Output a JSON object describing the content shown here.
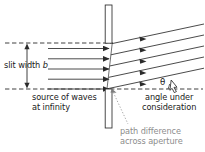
{
  "figure": {
    "background_color": "#ffffff",
    "line_color": "#2b2b2b",
    "gray_color": "#8d8d8d"
  },
  "labels": {
    "slit_width": {
      "text_prefix": "slit width ",
      "symbol": "b"
    },
    "source": {
      "line1": "source of waves",
      "line2": "at infinity"
    },
    "angle_note": {
      "line1": "angle under",
      "line2": "consideration"
    },
    "path_difference": {
      "line1": "path difference",
      "line2": "across aperture"
    },
    "theta": "θ"
  },
  "geometry": {
    "incoming_ray_count": 5,
    "outgoing_ray_count": 5,
    "slit_top_y": 43,
    "slit_bottom_y": 89,
    "slit_x": 110,
    "aperture_plate_x": 105,
    "aperture_plate_width": 7,
    "upper_plate_top_y": 5,
    "upper_plate_bottom_y": 43,
    "lower_plate_top_y": 89,
    "lower_plate_bottom_y": 128,
    "outgoing_angle_degrees": 12,
    "axis_dash_y": 89,
    "slit_width_dash_y": 43
  }
}
